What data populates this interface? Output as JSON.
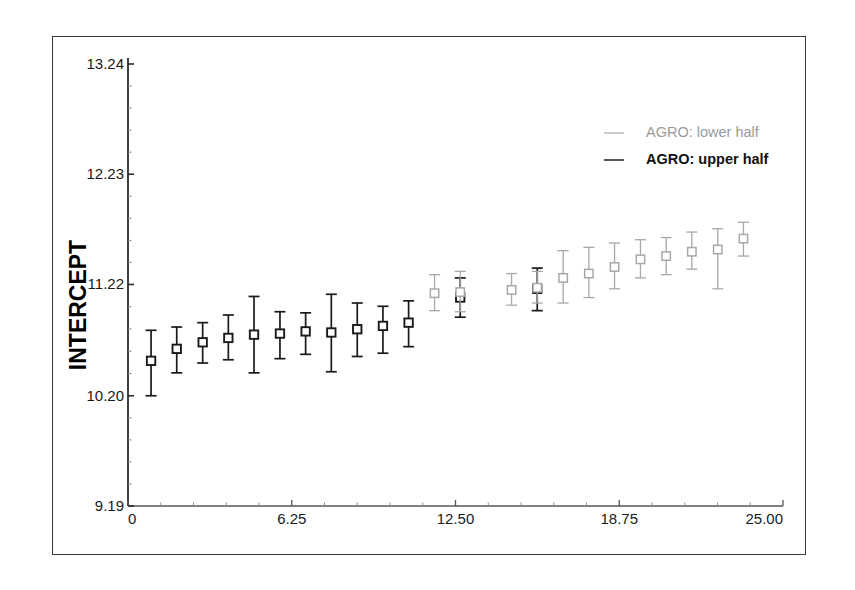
{
  "chart_data": {
    "type": "scatter",
    "title": "",
    "subtitle": "",
    "xlabel": "",
    "ylabel": "INTERCEPT",
    "xlim": [
      0,
      25.0
    ],
    "ylim": [
      9.19,
      13.24
    ],
    "grid": false,
    "legend_position": "top-right",
    "error_bars": true,
    "marker": "open-square",
    "x_ticks": [
      "0",
      "6.25",
      "12.50",
      "18.75",
      "25.00"
    ],
    "x_tick_values": [
      0,
      6.25,
      12.5,
      18.75,
      25.0
    ],
    "y_ticks": [
      "9.19",
      "10.20",
      "11.22",
      "12.23",
      "13.24"
    ],
    "y_tick_values": [
      9.19,
      10.2,
      11.22,
      12.23,
      13.24
    ],
    "series": [
      {
        "name": "AGRO: upper half",
        "color": "#1a1a1a",
        "x": [
          0.88,
          1.86,
          2.85,
          3.83,
          4.81,
          5.8,
          6.78,
          7.76,
          8.75,
          9.73,
          10.71,
          12.68,
          15.62
        ],
        "y": [
          10.52,
          10.63,
          10.69,
          10.73,
          10.76,
          10.77,
          10.79,
          10.78,
          10.81,
          10.84,
          10.87,
          11.1,
          11.18
        ],
        "y_low": [
          10.2,
          10.41,
          10.5,
          10.53,
          10.41,
          10.54,
          10.58,
          10.42,
          10.56,
          10.59,
          10.65,
          10.92,
          10.98
        ],
        "y_high": [
          10.8,
          10.83,
          10.87,
          10.94,
          11.11,
          10.97,
          10.96,
          11.13,
          11.05,
          11.02,
          11.07,
          11.28,
          11.37
        ]
      },
      {
        "name": "AGRO: lower half",
        "color": "#a8a8a8",
        "x": [
          11.7,
          12.68,
          14.64,
          15.62,
          16.61,
          17.59,
          18.57,
          19.56,
          20.54,
          21.52,
          22.51,
          23.49
        ],
        "y": [
          11.14,
          11.15,
          11.17,
          11.19,
          11.28,
          11.32,
          11.38,
          11.45,
          11.48,
          11.52,
          11.54,
          11.64
        ],
        "y_low": [
          10.98,
          10.97,
          11.03,
          11.05,
          11.05,
          11.1,
          11.18,
          11.28,
          11.31,
          11.36,
          11.18,
          11.48
        ],
        "y_high": [
          11.31,
          11.34,
          11.32,
          11.34,
          11.53,
          11.56,
          11.6,
          11.63,
          11.65,
          11.7,
          11.73,
          11.79
        ]
      }
    ]
  },
  "legend": {
    "entries": [
      {
        "label": "AGRO: lower half",
        "color": "#a8a8a8"
      },
      {
        "label": "AGRO: upper half",
        "color": "#111111"
      }
    ]
  },
  "axes": {
    "y_title": "INTERCEPT",
    "y_tick_labels": [
      "13.24",
      "12.23",
      "11.22",
      "10.20",
      "9.19"
    ],
    "x_tick_labels": [
      "0",
      "6.25",
      "12.50",
      "18.75",
      "25.00"
    ]
  }
}
